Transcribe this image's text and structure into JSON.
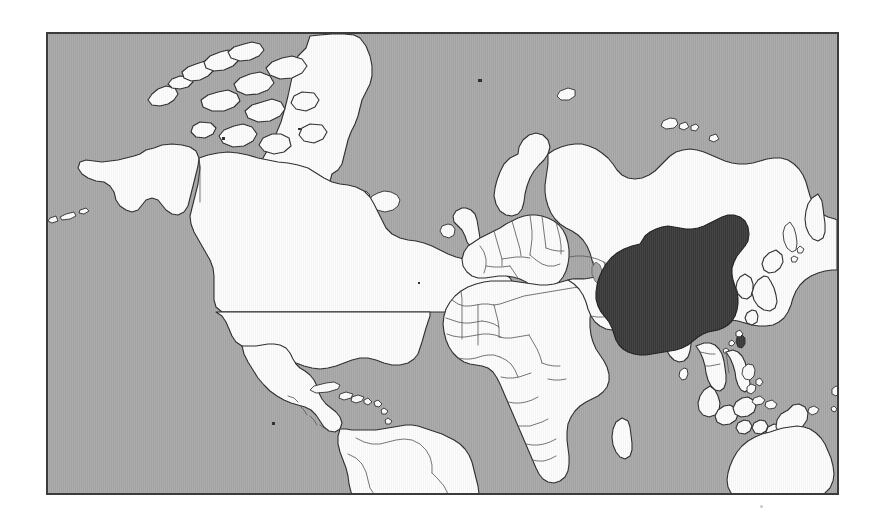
{
  "figure": {
    "type": "choropleth-locator-map",
    "title": "World map with one country highlighted",
    "projection": "equirectangular",
    "caption": ""
  },
  "map": {
    "frame": {
      "border_color": "#3b3b3b",
      "border_width_px": 2,
      "left_px": 46,
      "top_px": 32,
      "width_px": 793,
      "height_px": 463
    },
    "colors": {
      "page_background": "#ffffff",
      "ocean": "#a8a8a8",
      "land_fill": "#fdfdfd",
      "land_outline": "#2b2b2b",
      "internal_border": "#5a5a5a",
      "highlight_fill": "#3a3a3a",
      "highlight_outline": "#1d1d1d"
    },
    "legend": {
      "visible": false,
      "entries": [
        {
          "label": "Highlighted country",
          "color": "#3a3a3a"
        },
        {
          "label": "Other land",
          "color": "#fdfdfd"
        },
        {
          "label": "Ocean",
          "color": "#a8a8a8"
        }
      ]
    },
    "graticule": {
      "visible": false
    },
    "labels": {
      "visible": false,
      "items": []
    },
    "scale_bar": {
      "visible": false
    },
    "north_arrow": {
      "visible": false
    }
  },
  "highlight": {
    "name": "China",
    "iso_code": "CHN",
    "continent": "Asia",
    "fill_color": "#3a3a3a",
    "count": 1
  },
  "regions": [
    {
      "name": "North America",
      "highlighted": false
    },
    {
      "name": "South America",
      "highlighted": false
    },
    {
      "name": "Europe",
      "highlighted": false
    },
    {
      "name": "Africa",
      "highlighted": false
    },
    {
      "name": "Asia",
      "highlighted": true
    },
    {
      "name": "Oceania",
      "highlighted": false
    },
    {
      "name": "Greenland",
      "highlighted": false
    }
  ],
  "landmasses": [
    "Alaska",
    "Canada",
    "United States",
    "Mexico",
    "Central America",
    "Greenland",
    "Iceland",
    "Caribbean Islands",
    "South America",
    "British Isles",
    "Scandinavia",
    "Continental Europe",
    "North Africa",
    "Sub-Saharan Africa",
    "Madagascar",
    "Middle East",
    "Russia",
    "Central Asia",
    "India",
    "China",
    "Korea",
    "Japan",
    "Southeast Asia",
    "Indonesia",
    "Philippines",
    "Papua New Guinea",
    "Australia",
    "New Zealand",
    "Tasmania",
    "Sri Lanka",
    "Taiwan"
  ],
  "artifacts": {
    "scan_texture": "vertical-line-scan",
    "speck_bottom_right": true
  }
}
